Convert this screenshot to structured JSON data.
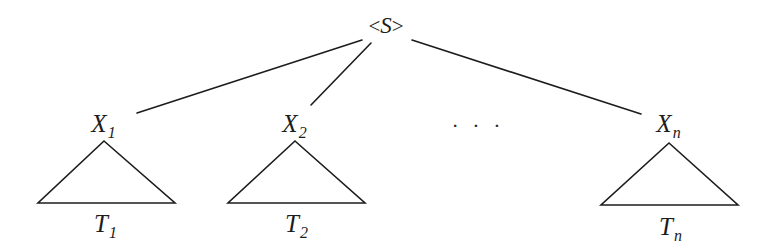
{
  "figure": {
    "kind": "parse-tree-diagram",
    "width": 773,
    "height": 252,
    "background_color": "#ffffff",
    "ink_color": "#1c1c1c",
    "stroke_width": 1.6
  },
  "root": {
    "name": "root-node",
    "text": "<S>",
    "open_angle": "<",
    "symbol": "S",
    "close_angle": ">",
    "x": 386,
    "y": 26
  },
  "children": [
    {
      "name": "child-node-1",
      "label": "X1",
      "base": "X",
      "subscript": "1",
      "x": 103,
      "y": 123
    },
    {
      "name": "child-node-2",
      "label": "X2",
      "base": "X",
      "subscript": "2",
      "x": 294,
      "y": 123
    },
    {
      "name": "child-node-n",
      "label": "Xn",
      "base": "X",
      "subscript": "n",
      "x": 668,
      "y": 123
    }
  ],
  "ellipsis": {
    "name": "ellipsis",
    "text": "· · ·",
    "glyph": "· · ·",
    "x": 478,
    "y": 127
  },
  "subtrees": [
    {
      "name": "subtree-triangle-1",
      "label": "T1",
      "base": "T",
      "subscript": "1",
      "apex_x": 104,
      "apex_y": 141,
      "base_left_x": 38,
      "base_right_x": 175,
      "base_y": 203,
      "label_x": 105,
      "label_y": 223
    },
    {
      "name": "subtree-triangle-2",
      "label": "T2",
      "base": "T",
      "subscript": "2",
      "apex_x": 295,
      "apex_y": 141,
      "base_left_x": 228,
      "base_right_x": 365,
      "base_y": 203,
      "label_x": 296,
      "label_y": 223
    },
    {
      "name": "subtree-triangle-n",
      "label": "Tn",
      "base": "T",
      "subscript": "n",
      "apex_x": 669,
      "apex_y": 143,
      "base_left_x": 601,
      "base_right_x": 738,
      "base_y": 205,
      "label_x": 670,
      "label_y": 226
    }
  ],
  "edges": [
    {
      "name": "edge-root-to-x1",
      "from": "root",
      "to": "X1",
      "x1": 362,
      "y1": 40,
      "x2": 137,
      "y2": 113
    },
    {
      "name": "edge-root-to-x2",
      "from": "root",
      "to": "X2",
      "x1": 371,
      "y1": 43,
      "x2": 311,
      "y2": 105
    },
    {
      "name": "edge-root-to-xn",
      "from": "root",
      "to": "Xn",
      "x1": 412,
      "y1": 40,
      "x2": 641,
      "y2": 114
    }
  ]
}
